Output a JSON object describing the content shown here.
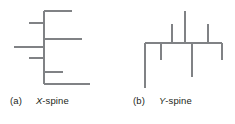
{
  "figure": {
    "background_color": "#ffffff",
    "stroke_color": "#808285",
    "text_color": "#231f20",
    "stroke_width": 1.2,
    "panels": [
      {
        "id": "panel-a",
        "tag": "(a)",
        "name_symbol": "X",
        "name_suffix": "-spine",
        "name_full": "X-spine",
        "type": "x-spine",
        "spine": {
          "orientation": "vertical",
          "x": 44,
          "y1": 11,
          "y2": 84
        },
        "branches": [
          {
            "id": "a-branch-1",
            "direction": "right",
            "y": 11,
            "x_from": 44,
            "x_to": 72
          },
          {
            "id": "a-branch-2",
            "direction": "left",
            "y": 23,
            "x_from": 44,
            "x_to": 29
          },
          {
            "id": "a-branch-3",
            "direction": "right",
            "y": 39,
            "x_from": 44,
            "x_to": 82
          },
          {
            "id": "a-branch-4",
            "direction": "left",
            "y": 47,
            "x_from": 44,
            "x_to": 14
          },
          {
            "id": "a-branch-5",
            "direction": "left",
            "y": 58,
            "x_from": 44,
            "x_to": 29
          },
          {
            "id": "a-branch-6",
            "direction": "right",
            "y": 72,
            "x_from": 44,
            "x_to": 63
          },
          {
            "id": "a-branch-7",
            "direction": "right",
            "y": 84,
            "x_from": 44,
            "x_to": 90
          }
        ]
      },
      {
        "id": "panel-b",
        "tag": "(b)",
        "name_symbol": "Y",
        "name_suffix": "-spine",
        "name_full": "Y-spine",
        "type": "y-spine",
        "spine": {
          "orientation": "horizontal",
          "y": 43,
          "x1": 145,
          "x2": 222
        },
        "branches": [
          {
            "id": "b-branch-up-1",
            "direction": "up",
            "x": 172,
            "y_from": 43,
            "y_to": 24
          },
          {
            "id": "b-branch-up-2",
            "direction": "up",
            "x": 185,
            "y_from": 43,
            "y_to": 11
          },
          {
            "id": "b-branch-up-3",
            "direction": "up",
            "x": 208,
            "y_from": 43,
            "y_to": 24
          },
          {
            "id": "b-branch-down-1",
            "direction": "down",
            "x": 145,
            "y_from": 43,
            "y_to": 88
          },
          {
            "id": "b-branch-down-2",
            "direction": "down",
            "x": 161,
            "y_from": 43,
            "y_to": 60
          },
          {
            "id": "b-branch-down-3",
            "direction": "down",
            "x": 192,
            "y_from": 43,
            "y_to": 77
          },
          {
            "id": "b-branch-down-4",
            "direction": "down",
            "x": 222,
            "y_from": 43,
            "y_to": 60
          }
        ]
      }
    ]
  }
}
